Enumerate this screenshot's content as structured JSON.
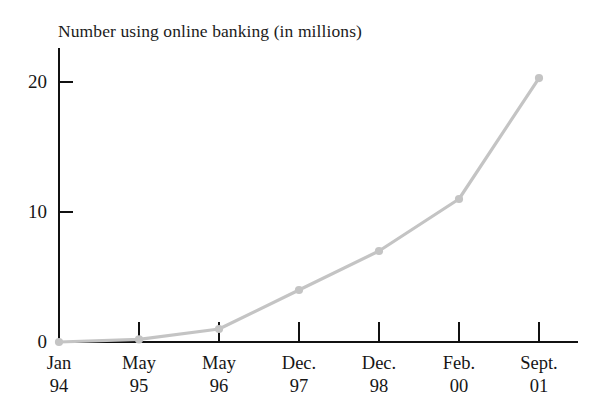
{
  "chart_data": {
    "type": "line",
    "title": "Number using online banking (in millions)",
    "xlabel": "",
    "ylabel": "",
    "categories": [
      "Jan 94",
      "May 95",
      "May 96",
      "Dec. 97",
      "Dec. 98",
      "Feb. 00",
      "Sept. 01"
    ],
    "category_lines": [
      {
        "line1": "Jan",
        "line2": "94"
      },
      {
        "line1": "May",
        "line2": "95"
      },
      {
        "line1": "May",
        "line2": "96"
      },
      {
        "line1": "Dec.",
        "line2": "97"
      },
      {
        "line1": "Dec.",
        "line2": "98"
      },
      {
        "line1": "Feb.",
        "line2": "00"
      },
      {
        "line1": "Sept.",
        "line2": "01"
      }
    ],
    "values": [
      0,
      0.2,
      1,
      4,
      7,
      11,
      20.3
    ],
    "ylim": [
      0,
      22.5
    ],
    "yticks": [
      0,
      10,
      20
    ],
    "ytick_labels": [
      "0",
      "10",
      "20"
    ],
    "grid": false,
    "legend": false,
    "markers": "circle",
    "series_color": "#c4c4c4",
    "axis_color": "#111111",
    "text_color": "#161616",
    "background": "#ffffff"
  },
  "artifact": {
    "top_clipped_text": "  "
  }
}
